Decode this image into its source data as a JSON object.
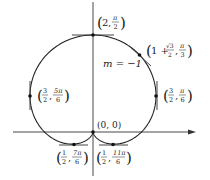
{
  "diagram": {
    "curve": "r = 1 + sin θ (cardioid)",
    "colors": {
      "curve": "#222222",
      "axis": "#333333",
      "tangent": "#444444",
      "background": "#ffffff"
    },
    "slope_label": "m = −1",
    "points": [
      {
        "id": "top",
        "r": "2",
        "theta": "π/2"
      },
      {
        "id": "upper-right",
        "r_int": "1 +",
        "r_num": "√3",
        "r_den": "2",
        "theta_num": "π",
        "theta_den": "3"
      },
      {
        "id": "right",
        "r_num": "3",
        "r_den": "2",
        "theta_num": "π",
        "theta_den": "6"
      },
      {
        "id": "left",
        "r_num": "3",
        "r_den": "2",
        "theta_num": "5π",
        "theta_den": "6"
      },
      {
        "id": "origin",
        "label": "(0, 0)"
      },
      {
        "id": "bottom-left",
        "r_num": "1",
        "r_den": "2",
        "theta_num": "7π",
        "theta_den": "6"
      },
      {
        "id": "bottom-right",
        "r_num": "1",
        "r_den": "2",
        "theta_num": "11π",
        "theta_den": "6"
      }
    ]
  }
}
